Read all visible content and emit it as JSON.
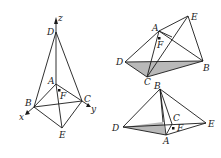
{
  "figure_left": {
    "labels": {
      "z": "z",
      "D": "D",
      "A": "A",
      "F": "F",
      "B": "B",
      "C": "C",
      "x": "x",
      "y": "y",
      "E": "E"
    }
  },
  "figure_top_right": {
    "labels": {
      "A": "A",
      "E": "E",
      "F": "F",
      "D": "D",
      "B": "B",
      "C": "C"
    },
    "shaded_face": "DCB",
    "shade_color": "#b9b9b9"
  },
  "figure_bottom_right": {
    "labels": {
      "B": "B",
      "C": "C",
      "D": "D",
      "E": "E",
      "F": "F",
      "A": "A"
    },
    "shaded_face": "DAC",
    "shade_color": "#b9b9b9"
  }
}
